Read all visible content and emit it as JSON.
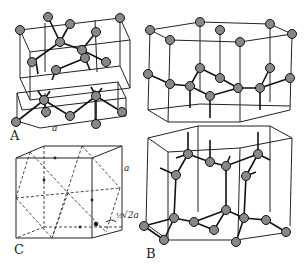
{
  "figure": {
    "panels": [
      {
        "id": "A",
        "label": "A",
        "description": "diamond cubic structure, unit cell split into two layers",
        "dimension_label": "a"
      },
      {
        "id": "B",
        "label": "B",
        "description": "hexagonal (wurtzite-like) structure shown in two hexagonal prism layers"
      },
      {
        "id": "C",
        "label": "C",
        "description": "cube with dashed face-diagonal construction",
        "edge_label": "a",
        "annotation": "½√2a"
      }
    ]
  },
  "labels": {
    "A": "A",
    "B": "B",
    "C": "C",
    "a_A": "a",
    "a_C": "a",
    "half": "½",
    "sqrt2a": "√2a"
  }
}
